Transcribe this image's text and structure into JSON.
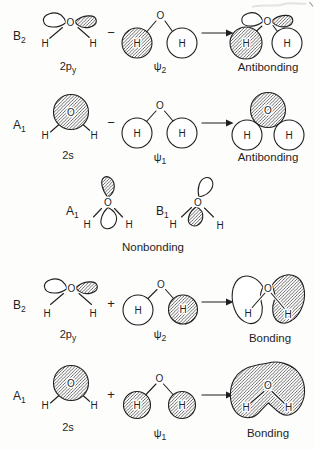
{
  "colors": {
    "ink": "#1f1f1f",
    "paper": "#fdfdfb"
  },
  "atoms": {
    "oxygen": "O",
    "hydrogen": "H"
  },
  "rows": {
    "antibonding_b2": {
      "symmetry": {
        "main": "B",
        "sub": "2"
      },
      "orbital_label": {
        "main": "2p",
        "sub": "y"
      },
      "operator": "−",
      "psi_label": {
        "main": "ψ",
        "sub": "2"
      },
      "result": "Antibonding"
    },
    "antibonding_a1": {
      "symmetry": {
        "main": "A",
        "sub": "1"
      },
      "orbital_label": {
        "main": "2s",
        "sub": ""
      },
      "operator": "−",
      "psi_label": {
        "main": "ψ",
        "sub": "1"
      },
      "result": "Antibonding"
    },
    "nonbonding": {
      "left_label": {
        "main": "A",
        "sub": "1"
      },
      "right_label": {
        "main": "B",
        "sub": "1"
      },
      "caption": "Nonbonding"
    },
    "bonding_b2": {
      "symmetry": {
        "main": "B",
        "sub": "2"
      },
      "orbital_label": {
        "main": "2p",
        "sub": "y"
      },
      "operator": "+",
      "psi_label": {
        "main": "ψ",
        "sub": "2"
      },
      "result": "Bonding"
    },
    "bonding_a1": {
      "symmetry": {
        "main": "A",
        "sub": "1"
      },
      "orbital_label": {
        "main": "2s",
        "sub": ""
      },
      "operator": "+",
      "psi_label": {
        "main": "ψ",
        "sub": "1"
      },
      "result": "Bonding"
    }
  }
}
